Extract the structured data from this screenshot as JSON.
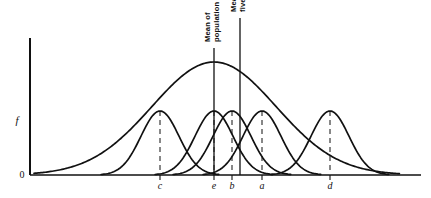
{
  "figure": {
    "background_color": "#ffffff",
    "ink_color": "#111111",
    "dashed_color": "#555555",
    "width": 431,
    "height": 198
  },
  "axes": {
    "y_axis_label": "f",
    "origin_label": "0",
    "x_axis_label": "",
    "x_origin_px": 30,
    "x_end_px": 421,
    "y_top_px": 38,
    "y_baseline_px": 175
  },
  "annotations": [
    {
      "id": "mean-of-population",
      "lines": [
        "Mean of",
        "population"
      ],
      "text": "Mean of population",
      "x_px": 214,
      "line_top_px": 48,
      "line_bottom_px": 175,
      "rotated": true
    },
    {
      "id": "mean-of-five-sets",
      "lines": [
        "Mean of",
        "five sets"
      ],
      "text": "Mean of five sets",
      "x_px": 240,
      "line_top_px": 18,
      "line_bottom_px": 175,
      "rotated": true
    }
  ],
  "chart_data": {
    "type": "line",
    "title": "",
    "xlabel": "",
    "ylabel": "f",
    "grid": false,
    "legend": false,
    "xlim": [
      30,
      421
    ],
    "ylim": [
      0,
      1
    ],
    "x_tick_labels": [
      "c",
      "e",
      "b",
      "a",
      "d"
    ],
    "x_tick_positions_px": [
      160,
      214,
      232,
      262,
      330
    ],
    "curves": [
      {
        "name": "population",
        "kind": "normal",
        "mean_px": 214,
        "sigma_px": 62,
        "peak_height_px": 113,
        "style": "solid",
        "description": "broad population distribution"
      },
      {
        "name": "sample-c",
        "kind": "normal",
        "mean_px": 160,
        "sigma_px": 19,
        "peak_height_px": 64,
        "style": "solid",
        "description": "narrow sample set c"
      },
      {
        "name": "sample-e",
        "kind": "normal",
        "mean_px": 214,
        "sigma_px": 19,
        "peak_height_px": 64,
        "style": "solid",
        "description": "narrow sample set e"
      },
      {
        "name": "sample-b",
        "kind": "normal",
        "mean_px": 232,
        "sigma_px": 19,
        "peak_height_px": 64,
        "style": "solid",
        "description": "narrow sample set b"
      },
      {
        "name": "sample-a",
        "kind": "normal",
        "mean_px": 262,
        "sigma_px": 19,
        "peak_height_px": 64,
        "style": "solid",
        "description": "narrow sample set a"
      },
      {
        "name": "sample-d",
        "kind": "normal",
        "mean_px": 330,
        "sigma_px": 19,
        "peak_height_px": 64,
        "style": "solid",
        "description": "narrow sample set d"
      }
    ],
    "dashed_markers": [
      {
        "label": "c",
        "x_px": 160,
        "top_px": 111,
        "bottom_px": 175
      },
      {
        "label": "e",
        "x_px": 214,
        "top_px": 111,
        "bottom_px": 175
      },
      {
        "label": "b",
        "x_px": 232,
        "top_px": 111,
        "bottom_px": 175
      },
      {
        "label": "a",
        "x_px": 262,
        "top_px": 111,
        "bottom_px": 175
      },
      {
        "label": "d",
        "x_px": 330,
        "top_px": 111,
        "bottom_px": 175
      }
    ]
  }
}
